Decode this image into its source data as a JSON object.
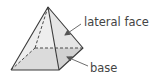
{
  "diagram": {
    "labels": {
      "lateral_face": "lateral face",
      "base": "base"
    },
    "colors": {
      "lateral_fill": "#e6e6e6",
      "base_fill": "#b5b5b5",
      "edge": "#3a3a3a",
      "text": "#444444",
      "leader": "#6e6e6e"
    }
  }
}
